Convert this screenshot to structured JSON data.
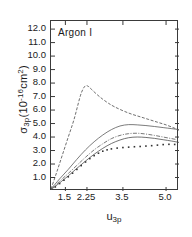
{
  "chart_data": {
    "type": "line",
    "title": "Argon I",
    "xlabel": "u3p",
    "ylabel": "σ3p(10-16cm2)",
    "ylabel_parts": {
      "symbol": "σ",
      "symbol_sub": "3p",
      "unit_open": "(10",
      "unit_exp": "-16",
      "unit_rest": "cm",
      "unit_rest_exp": "2",
      "unit_close": ")"
    },
    "xlabel_parts": {
      "symbol": "u",
      "symbol_sub": "3p"
    },
    "xticks": [
      1.5,
      2.25,
      3.5,
      5.0
    ],
    "xtick_labels": [
      "1.5",
      "2.25",
      "3.5",
      "5.0"
    ],
    "yticks": [
      1.0,
      2.0,
      3.0,
      4.0,
      5.0,
      6.0,
      7.0,
      8.0,
      9.0,
      10.0,
      11.0,
      12.0
    ],
    "ytick_labels": [
      "1.0",
      "2.0",
      "3.0",
      "4.0",
      "5.0",
      "6.0",
      "7.0",
      "8.0",
      "9.0",
      "10.0",
      "11.0",
      "12.0"
    ],
    "xlim": [
      1.0,
      5.45
    ],
    "ylim": [
      0.0,
      12.6
    ],
    "grid": false,
    "legend": "none",
    "axis_color": "#3a3a3a",
    "series": [
      {
        "name": "curve-1-peaked-dashed",
        "style": "dashed",
        "color": "#4a4a4a",
        "x": [
          1.0,
          1.2,
          1.4,
          1.6,
          1.8,
          2.0,
          2.1,
          2.2,
          2.3,
          2.4,
          2.6,
          2.8,
          3.0,
          3.2,
          3.5,
          3.8,
          4.1,
          4.4,
          4.7,
          5.0,
          5.3,
          5.45
        ],
        "y": [
          0.15,
          1.4,
          2.7,
          4.0,
          5.3,
          6.9,
          7.5,
          7.8,
          7.75,
          7.55,
          7.15,
          6.8,
          6.5,
          6.25,
          5.95,
          5.7,
          5.5,
          5.3,
          5.1,
          4.9,
          4.65,
          4.5
        ]
      },
      {
        "name": "curve-2-upper-solid",
        "style": "solid",
        "color": "#5a5a5a",
        "x": [
          1.0,
          1.3,
          1.6,
          1.9,
          2.2,
          2.5,
          2.8,
          3.1,
          3.4,
          3.7,
          4.0,
          4.3,
          4.6,
          4.9,
          5.2,
          5.45
        ],
        "y": [
          0.15,
          0.9,
          1.6,
          2.35,
          3.05,
          3.65,
          4.15,
          4.55,
          4.82,
          4.92,
          4.9,
          4.85,
          4.78,
          4.7,
          4.62,
          4.55
        ]
      },
      {
        "name": "curve-3-middle-dashdot",
        "style": "dashdot",
        "color": "#555555",
        "x": [
          1.0,
          1.3,
          1.6,
          1.9,
          2.2,
          2.5,
          2.8,
          3.1,
          3.4,
          3.7,
          4.0,
          4.3,
          4.6,
          4.9,
          5.2,
          5.45
        ],
        "y": [
          0.12,
          0.72,
          1.3,
          1.9,
          2.5,
          3.05,
          3.5,
          3.88,
          4.12,
          4.25,
          4.28,
          4.22,
          4.12,
          4.0,
          3.88,
          3.78
        ]
      },
      {
        "name": "curve-4-lower-solid",
        "style": "solid",
        "color": "#4f4f4f",
        "x": [
          1.0,
          1.3,
          1.6,
          1.9,
          2.2,
          2.5,
          2.8,
          3.1,
          3.4,
          3.7,
          4.0,
          4.3,
          4.6,
          4.9,
          5.2,
          5.45
        ],
        "y": [
          0.1,
          0.6,
          1.12,
          1.68,
          2.22,
          2.72,
          3.16,
          3.52,
          3.78,
          3.95,
          4.0,
          3.97,
          3.9,
          3.8,
          3.7,
          3.6
        ]
      },
      {
        "name": "curve-5-dotted-experimental",
        "style": "dotted",
        "color": "#333333",
        "x": [
          1.15,
          1.3,
          1.45,
          1.6,
          1.75,
          1.9,
          2.05,
          2.2,
          2.35,
          2.5,
          2.65,
          2.8,
          2.95,
          3.1,
          3.3,
          3.5,
          3.7,
          3.9,
          4.1,
          4.3,
          4.5,
          4.7,
          4.9,
          5.1,
          5.3
        ],
        "y": [
          0.3,
          0.55,
          0.8,
          1.05,
          1.32,
          1.6,
          1.88,
          2.15,
          2.4,
          2.62,
          2.8,
          2.95,
          3.05,
          3.12,
          3.18,
          3.22,
          3.25,
          3.28,
          3.3,
          3.33,
          3.36,
          3.4,
          3.44,
          3.46,
          3.45
        ]
      }
    ]
  }
}
